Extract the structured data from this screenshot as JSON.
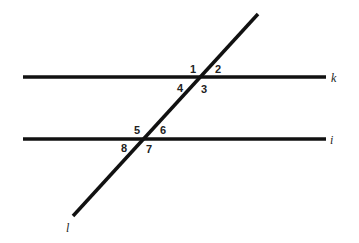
{
  "diagram": {
    "line_color": "#111111",
    "lines": [
      {
        "name": "k",
        "label": "k",
        "type": "parallel",
        "x1": 23,
        "y1": 77,
        "x2": 326,
        "y2": 77
      },
      {
        "name": "i",
        "label": "i",
        "type": "parallel",
        "x1": 23,
        "y1": 139,
        "x2": 326,
        "y2": 139
      },
      {
        "name": "l",
        "label": "l",
        "type": "transversal",
        "x1": 258,
        "y1": 14,
        "x2": 73,
        "y2": 216
      }
    ],
    "angles": [
      {
        "label": "1",
        "x": 190,
        "y": 73
      },
      {
        "label": "2",
        "x": 215,
        "y": 73
      },
      {
        "label": "3",
        "x": 201,
        "y": 93
      },
      {
        "label": "4",
        "x": 177,
        "y": 92
      },
      {
        "label": "5",
        "x": 134,
        "y": 134
      },
      {
        "label": "6",
        "x": 160,
        "y": 134
      },
      {
        "label": "7",
        "x": 146,
        "y": 153
      },
      {
        "label": "8",
        "x": 121,
        "y": 152
      }
    ],
    "line_labels": [
      {
        "label": "k",
        "x": 331,
        "y": 82
      },
      {
        "label": "i",
        "x": 330,
        "y": 144
      },
      {
        "label": "l",
        "x": 66,
        "y": 232
      }
    ]
  }
}
